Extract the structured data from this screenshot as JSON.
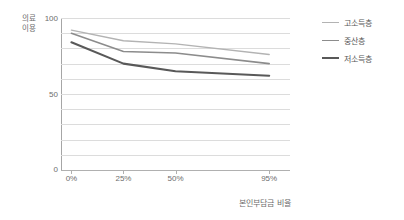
{
  "chart_data": {
    "type": "line",
    "title": "",
    "xlabel": "본인부담금 비율",
    "ylabel": "의료이용",
    "categories": [
      "0%",
      "25%",
      "50%",
      "95%"
    ],
    "x_positions": [
      0,
      25,
      50,
      95
    ],
    "xlim": [
      -5,
      105
    ],
    "ylim": [
      0,
      100
    ],
    "y_ticks": [
      0,
      50,
      100
    ],
    "y_tick_labels": [
      "0",
      "50",
      "100"
    ],
    "gridlines": [
      0,
      10,
      20,
      30,
      40,
      50,
      60,
      70,
      80,
      90,
      100
    ],
    "grid": true,
    "legend_position": "right",
    "series": [
      {
        "name": "고소득층",
        "color": "#b3b3b3",
        "width": 1.4,
        "values": [
          92,
          85,
          83,
          76
        ]
      },
      {
        "name": "중산층",
        "color": "#8c8c8c",
        "width": 1.6,
        "values": [
          90,
          78,
          77,
          70
        ]
      },
      {
        "name": "저소득층",
        "color": "#595959",
        "width": 2.1,
        "values": [
          84,
          70,
          65,
          62
        ]
      }
    ]
  },
  "axes": {
    "y_title": "의료이용",
    "x_title": "본인부담금 비율",
    "y_tick_top": "100",
    "y_tick_mid": "50",
    "y_tick_bottom": "0",
    "x_tick_0": "0%",
    "x_tick_1": "25%",
    "x_tick_2": "50%",
    "x_tick_3": "95%"
  },
  "legend": {
    "items": [
      {
        "label": "고소득층",
        "color": "#b3b3b3",
        "thickness": "1.4px"
      },
      {
        "label": "중산층",
        "color": "#8c8c8c",
        "thickness": "1.7px"
      },
      {
        "label": "저소득층",
        "color": "#595959",
        "thickness": "2.4px"
      }
    ]
  },
  "colors": {
    "background": "#ffffff",
    "grid": "#dcdcdc",
    "axis": "#a6a6a6",
    "text": "#6d6d6d"
  }
}
